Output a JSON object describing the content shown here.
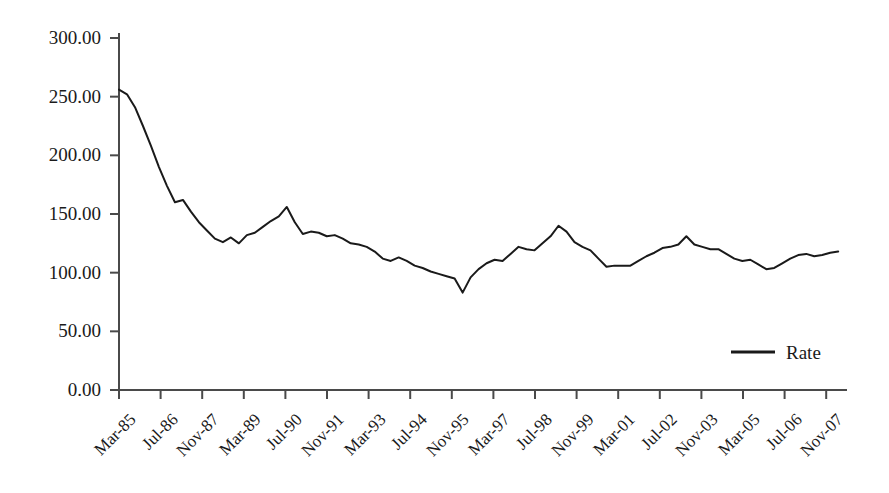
{
  "chart_data": {
    "type": "line",
    "title": "",
    "subtitle": "",
    "xlabel": "",
    "ylabel": "",
    "ylim": [
      0,
      300
    ],
    "ytick_labels": [
      "0.00",
      "50.00",
      "100.00",
      "150.00",
      "200.00",
      "250.00",
      "300.00"
    ],
    "ytick_values": [
      0,
      50,
      100,
      150,
      200,
      250,
      300
    ],
    "ytick_format": "0.00",
    "grid": false,
    "legend": {
      "position": "inside-bottom-right",
      "entries": [
        {
          "label": "Rate",
          "color": "#1a1a1a",
          "marker": "line"
        }
      ]
    },
    "xtick_labels": [
      "Mar-85",
      "Jul-86",
      "Nov-87",
      "Mar-89",
      "Jul-90",
      "Nov-91",
      "Mar-93",
      "Jul-94",
      "Nov-95",
      "Mar-97",
      "Jul-98",
      "Nov-99",
      "Mar-01",
      "Jul-02",
      "Nov-03",
      "Mar-05",
      "Jul-06",
      "Nov-07"
    ],
    "xtick_rotation_degrees": -45,
    "x_interval_months": 16,
    "x_data_frequency": "quarterly",
    "series": [
      {
        "name": "Rate",
        "color": "#1a1a1a",
        "line_width": 2,
        "x": [
          "Mar-85",
          "Jun-85",
          "Sep-85",
          "Dec-85",
          "Mar-86",
          "Jun-86",
          "Sep-86",
          "Dec-86",
          "Mar-87",
          "Jun-87",
          "Sep-87",
          "Dec-87",
          "Mar-88",
          "Jun-88",
          "Sep-88",
          "Dec-88",
          "Mar-89",
          "Jun-89",
          "Sep-89",
          "Dec-89",
          "Mar-90",
          "Jun-90",
          "Sep-90",
          "Dec-90",
          "Mar-91",
          "Jun-91",
          "Sep-91",
          "Dec-91",
          "Mar-92",
          "Jun-92",
          "Sep-92",
          "Dec-92",
          "Mar-93",
          "Jun-93",
          "Sep-93",
          "Dec-93",
          "Mar-94",
          "Jun-94",
          "Sep-94",
          "Dec-94",
          "Mar-95",
          "Jun-95",
          "Sep-95",
          "Dec-95",
          "Mar-96",
          "Jun-96",
          "Sep-96",
          "Dec-96",
          "Mar-97",
          "Jun-97",
          "Sep-97",
          "Dec-97",
          "Mar-98",
          "Jun-98",
          "Sep-98",
          "Dec-98",
          "Mar-99",
          "Jun-99",
          "Sep-99",
          "Dec-99",
          "Mar-00",
          "Jun-00",
          "Sep-00",
          "Dec-00",
          "Mar-01",
          "Jun-01",
          "Sep-01",
          "Dec-01",
          "Mar-02",
          "Jun-02",
          "Sep-02",
          "Dec-02",
          "Mar-03",
          "Jun-03",
          "Sep-03",
          "Dec-03",
          "Mar-04",
          "Jun-04",
          "Sep-04",
          "Dec-04",
          "Mar-05",
          "Jun-05",
          "Sep-05",
          "Dec-05",
          "Mar-06",
          "Jun-06",
          "Sep-06",
          "Dec-06",
          "Mar-07",
          "Jun-07",
          "Sep-07"
        ],
        "values": [
          256,
          252,
          241,
          225,
          208,
          190,
          174,
          160,
          162,
          152,
          143,
          136,
          129,
          126,
          130,
          125,
          132,
          134,
          139,
          144,
          148,
          156,
          143,
          133,
          135,
          134,
          131,
          132,
          129,
          125,
          124,
          122,
          118,
          112,
          110,
          113,
          110,
          106,
          104,
          101,
          99,
          97,
          95,
          83,
          96,
          103,
          108,
          111,
          110,
          116,
          122,
          120,
          119,
          125,
          131,
          140,
          135,
          126,
          122,
          119,
          112,
          105,
          106,
          106,
          106,
          110,
          114,
          117,
          121,
          122,
          124,
          131,
          124,
          122,
          120,
          120,
          116,
          112,
          110,
          111,
          107,
          103,
          104,
          108,
          112,
          115,
          116,
          114,
          115,
          117,
          118
        ]
      }
    ]
  },
  "axes": {
    "y_axis_name": "value-axis",
    "x_axis_name": "time-axis"
  }
}
